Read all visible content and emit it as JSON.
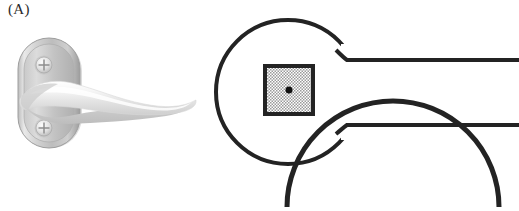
{
  "figure": {
    "panel_label": "(A)",
    "background_color": "#ffffff",
    "width": 519,
    "height": 211
  },
  "photograph": {
    "name": "door-lever-handle-photo",
    "description": "Satin chrome door lever handle on rounded oblong backplate",
    "backplate": {
      "description": "Rounded oblong escutcheon plate",
      "highlight_color": "#f2f2f2",
      "body_color": "#b9b9b9",
      "shadow_color": "#8f8f8f",
      "edge_color": "#a3a3a3",
      "bounds": {
        "x": 18,
        "y": 38,
        "width": 62,
        "height": 110
      }
    },
    "screws": [
      {
        "name": "screw-top",
        "type": "phillips-head",
        "cx": 44,
        "cy": 65,
        "r": 9
      },
      {
        "name": "screw-bottom",
        "type": "phillips-head",
        "cx": 44,
        "cy": 128,
        "r": 9
      }
    ],
    "lever": {
      "description": "Curved lever arm sweeping right to a rounded tapered tip",
      "highlight_color": "#fbfbfb",
      "body_color": "#e4e4e4",
      "shadow_color": "#c4c4c4",
      "tip_x": 195
    }
  },
  "technical_drawing": {
    "name": "door-lever-handle-line-drawing",
    "stroke_color": "#232323",
    "stroke_width": 4,
    "rose_circle": {
      "name": "rose-circle",
      "cx": 288,
      "cy": 92,
      "r": 72
    },
    "spindle_square": {
      "name": "spindle-square",
      "x": 265,
      "y": 66,
      "size": 48,
      "border_color": "#232323",
      "fill_pattern": "crosshatch",
      "fill_color": "#c8c8c8"
    },
    "center_dot": {
      "name": "spindle-center-dot",
      "cx": 288,
      "cy": 92,
      "r": 3.5,
      "color": "#111111"
    },
    "lever_neck_lines": [
      {
        "name": "lever-neck-line-top",
        "x1": 345,
        "y1": 60,
        "x2": 519,
        "y2": 60
      },
      {
        "name": "lever-neck-line-bottom",
        "x1": 345,
        "y1": 125,
        "x2": 519,
        "y2": 125
      }
    ],
    "lower_arc": {
      "name": "lower-rose-arc",
      "description": "Top edge of a second rose circle, cropped at bottom of frame",
      "cx": 393,
      "cy": 268,
      "r": 84
    }
  }
}
